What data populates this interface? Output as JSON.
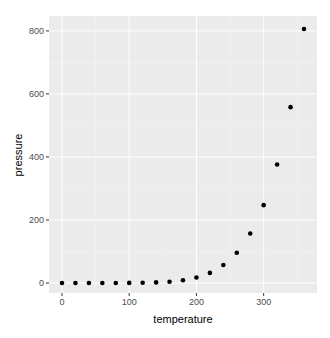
{
  "chart_data": {
    "type": "scatter",
    "title": "",
    "xlabel": "temperature",
    "ylabel": "pressure",
    "xlim": [
      0,
      360
    ],
    "ylim": [
      0,
      806
    ],
    "x_ticks": [
      0,
      100,
      200,
      300
    ],
    "y_ticks": [
      0,
      200,
      400,
      600,
      800
    ],
    "grid": true,
    "legend": null,
    "x": [
      0,
      20,
      40,
      60,
      80,
      100,
      120,
      140,
      160,
      180,
      200,
      220,
      240,
      260,
      280,
      300,
      320,
      340,
      360
    ],
    "y": [
      0.0002,
      0.0012,
      0.006,
      0.03,
      0.09,
      0.27,
      0.75,
      1.85,
      4.2,
      8.8,
      17.3,
      32.1,
      57,
      96,
      157,
      247,
      376,
      558,
      806
    ]
  },
  "colors": {
    "panel_bg": "#ebebeb",
    "grid_major": "#ffffff",
    "grid_minor": "#f5f5f5",
    "point": "#000000"
  }
}
